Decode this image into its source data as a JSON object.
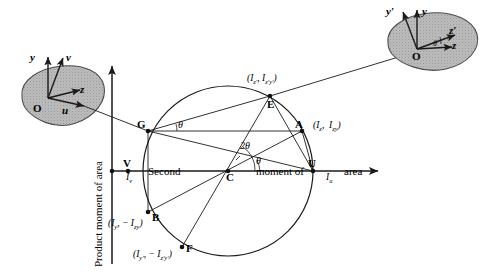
{
  "figure": {
    "type": "mohr-circle-second-moment-of-area",
    "axes": {
      "vertical_title": "Product moment of area",
      "horizontal_title_parts": [
        "Second",
        "moment of",
        "area"
      ],
      "horizontal_title": "Second moment of area"
    },
    "left_shape": {
      "origin_label": "O",
      "axis_y": "y",
      "axis_v": "v",
      "axis_z": "z",
      "axis_u": "u",
      "fill": "#b8b8b8"
    },
    "right_shape": {
      "origin_label": "O",
      "axis_y_prime": "y′",
      "axis_y": "y",
      "axis_z_prime": "z′",
      "axis_z": "z",
      "angle_label": "θ",
      "fill": "#b8b8b8"
    },
    "points": [
      {
        "name": "G",
        "label": "G",
        "x": 148,
        "y": 131
      },
      {
        "name": "E",
        "label": "E",
        "x": 270,
        "y": 96
      },
      {
        "name": "A",
        "label": "A",
        "x": 302,
        "y": 131
      },
      {
        "name": "V",
        "label": "V",
        "x": 128,
        "y": 171
      },
      {
        "name": "C",
        "label": "C",
        "x": 228,
        "y": 171
      },
      {
        "name": "U",
        "label": "U",
        "x": 313,
        "y": 171
      },
      {
        "name": "B",
        "label": "B",
        "x": 148,
        "y": 212
      },
      {
        "name": "F",
        "label": "F",
        "x": 182,
        "y": 247
      }
    ],
    "coordinate_labels": [
      {
        "for": "E",
        "text": "(I_z′ , I_z′y′)",
        "base": "I",
        "s1": "z′",
        "s2": "z′y′"
      },
      {
        "for": "A",
        "text": "(I_z , I_zy)",
        "base": "I",
        "s1": "z",
        "s2": "zy"
      },
      {
        "for": "B",
        "text": "(I_y , − I_zy)",
        "base": "I",
        "s1": "y",
        "s2": "zy"
      },
      {
        "for": "F",
        "text": "(I_y′ , − I_z′y′)",
        "base": "I",
        "s1": "y′",
        "s2": "z′y′"
      }
    ],
    "axis_value_labels": [
      {
        "for": "V",
        "base": "I",
        "sub": "v"
      },
      {
        "for": "U",
        "base": "I",
        "sub": "u"
      }
    ],
    "angles": [
      {
        "label": "θ",
        "at": "G",
        "x": 176,
        "y": 122
      },
      {
        "label": "2θ",
        "at": "C",
        "x": 243,
        "y": 148
      },
      {
        "label": "θ",
        "at": "C",
        "x": 255,
        "y": 164
      }
    ],
    "colors": {
      "stroke": "#1a1a1a",
      "shape_fill": "#b8b8b8",
      "shape_stroke": "#4d4d4d",
      "background": "#ffffff"
    },
    "circle": {
      "cx": 228,
      "cy": 171,
      "r": 85
    }
  }
}
